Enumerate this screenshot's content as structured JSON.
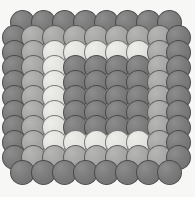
{
  "figure": {
    "canvas": {
      "width": 195,
      "height": 197
    },
    "background_color": "#f7f7f5",
    "outline_color": "#282828"
  },
  "palette": {
    "dark": "#7c7c7c",
    "mid": "#a6a6a4",
    "light": "#e2e2df",
    "background": "#f7f7f5"
  },
  "chart_data": {
    "type": "scatter",
    "title": "",
    "xlabel": "",
    "ylabel": "",
    "grid": false,
    "legend": "none",
    "xlim": [
      0,
      195
    ],
    "ylim": [
      0,
      197
    ],
    "marker": "circle",
    "marker_diameter": 25,
    "rings": [
      {
        "name": "outer-ring",
        "shade": "dark",
        "packing": "offset-hex",
        "rows": 11
      },
      {
        "name": "second-ring",
        "shade": "mid",
        "packing": "offset-hex",
        "rows": 9
      },
      {
        "name": "third-ring",
        "shade": "light",
        "packing": "offset-hex",
        "rows": 7
      },
      {
        "name": "core-block",
        "shade": "dark",
        "packing": "square",
        "rows": 5,
        "cols": 6
      }
    ],
    "series": [
      {
        "name": "dark-discs",
        "color": "#7c7c7c",
        "count": 76
      },
      {
        "name": "mid-discs",
        "color": "#a6a6a4",
        "count": 40
      },
      {
        "name": "light-discs",
        "color": "#e2e2df",
        "count": 28
      }
    ],
    "discs": [
      {
        "x": 22,
        "y": 22,
        "s": "dark"
      },
      {
        "x": 43,
        "y": 22,
        "s": "dark"
      },
      {
        "x": 64,
        "y": 22,
        "s": "dark"
      },
      {
        "x": 85,
        "y": 22,
        "s": "dark"
      },
      {
        "x": 106,
        "y": 22,
        "s": "dark"
      },
      {
        "x": 127,
        "y": 22,
        "s": "dark"
      },
      {
        "x": 148,
        "y": 22,
        "s": "dark"
      },
      {
        "x": 169,
        "y": 22,
        "s": "dark"
      },
      {
        "x": 14,
        "y": 37,
        "s": "dark"
      },
      {
        "x": 33,
        "y": 37,
        "s": "mid"
      },
      {
        "x": 54,
        "y": 37,
        "s": "mid"
      },
      {
        "x": 75,
        "y": 37,
        "s": "mid"
      },
      {
        "x": 96,
        "y": 37,
        "s": "mid"
      },
      {
        "x": 117,
        "y": 37,
        "s": "mid"
      },
      {
        "x": 138,
        "y": 37,
        "s": "mid"
      },
      {
        "x": 159,
        "y": 37,
        "s": "mid"
      },
      {
        "x": 178,
        "y": 37,
        "s": "dark"
      },
      {
        "x": 14,
        "y": 52,
        "s": "dark"
      },
      {
        "x": 33,
        "y": 52,
        "s": "mid"
      },
      {
        "x": 54,
        "y": 52,
        "s": "light"
      },
      {
        "x": 75,
        "y": 52,
        "s": "light"
      },
      {
        "x": 96,
        "y": 52,
        "s": "light"
      },
      {
        "x": 117,
        "y": 52,
        "s": "light"
      },
      {
        "x": 138,
        "y": 52,
        "s": "light"
      },
      {
        "x": 159,
        "y": 52,
        "s": "mid"
      },
      {
        "x": 178,
        "y": 52,
        "s": "dark"
      },
      {
        "x": 14,
        "y": 67,
        "s": "dark"
      },
      {
        "x": 33,
        "y": 67,
        "s": "mid"
      },
      {
        "x": 54,
        "y": 67,
        "s": "light"
      },
      {
        "x": 75,
        "y": 67,
        "s": "dark"
      },
      {
        "x": 96,
        "y": 67,
        "s": "dark"
      },
      {
        "x": 117,
        "y": 67,
        "s": "dark"
      },
      {
        "x": 138,
        "y": 67,
        "s": "dark"
      },
      {
        "x": 159,
        "y": 67,
        "s": "mid"
      },
      {
        "x": 178,
        "y": 67,
        "s": "dark"
      },
      {
        "x": 14,
        "y": 82,
        "s": "dark"
      },
      {
        "x": 33,
        "y": 82,
        "s": "mid"
      },
      {
        "x": 54,
        "y": 82,
        "s": "light"
      },
      {
        "x": 75,
        "y": 82,
        "s": "dark"
      },
      {
        "x": 96,
        "y": 82,
        "s": "dark"
      },
      {
        "x": 117,
        "y": 82,
        "s": "dark"
      },
      {
        "x": 138,
        "y": 82,
        "s": "dark"
      },
      {
        "x": 159,
        "y": 82,
        "s": "mid"
      },
      {
        "x": 178,
        "y": 82,
        "s": "dark"
      },
      {
        "x": 14,
        "y": 97,
        "s": "dark"
      },
      {
        "x": 33,
        "y": 97,
        "s": "mid"
      },
      {
        "x": 54,
        "y": 97,
        "s": "light"
      },
      {
        "x": 75,
        "y": 97,
        "s": "dark"
      },
      {
        "x": 96,
        "y": 97,
        "s": "dark"
      },
      {
        "x": 117,
        "y": 97,
        "s": "dark"
      },
      {
        "x": 138,
        "y": 97,
        "s": "dark"
      },
      {
        "x": 159,
        "y": 97,
        "s": "mid"
      },
      {
        "x": 178,
        "y": 97,
        "s": "dark"
      },
      {
        "x": 14,
        "y": 112,
        "s": "dark"
      },
      {
        "x": 33,
        "y": 112,
        "s": "mid"
      },
      {
        "x": 54,
        "y": 112,
        "s": "light"
      },
      {
        "x": 75,
        "y": 112,
        "s": "dark"
      },
      {
        "x": 96,
        "y": 112,
        "s": "dark"
      },
      {
        "x": 117,
        "y": 112,
        "s": "dark"
      },
      {
        "x": 138,
        "y": 112,
        "s": "dark"
      },
      {
        "x": 159,
        "y": 112,
        "s": "mid"
      },
      {
        "x": 178,
        "y": 112,
        "s": "dark"
      },
      {
        "x": 14,
        "y": 127,
        "s": "dark"
      },
      {
        "x": 33,
        "y": 127,
        "s": "mid"
      },
      {
        "x": 54,
        "y": 127,
        "s": "light"
      },
      {
        "x": 75,
        "y": 127,
        "s": "dark"
      },
      {
        "x": 96,
        "y": 127,
        "s": "dark"
      },
      {
        "x": 117,
        "y": 127,
        "s": "dark"
      },
      {
        "x": 138,
        "y": 127,
        "s": "dark"
      },
      {
        "x": 159,
        "y": 127,
        "s": "mid"
      },
      {
        "x": 178,
        "y": 127,
        "s": "dark"
      },
      {
        "x": 14,
        "y": 142,
        "s": "dark"
      },
      {
        "x": 33,
        "y": 142,
        "s": "mid"
      },
      {
        "x": 54,
        "y": 142,
        "s": "light"
      },
      {
        "x": 75,
        "y": 142,
        "s": "light"
      },
      {
        "x": 96,
        "y": 142,
        "s": "light"
      },
      {
        "x": 117,
        "y": 142,
        "s": "light"
      },
      {
        "x": 138,
        "y": 142,
        "s": "light"
      },
      {
        "x": 159,
        "y": 142,
        "s": "mid"
      },
      {
        "x": 178,
        "y": 142,
        "s": "dark"
      },
      {
        "x": 14,
        "y": 157,
        "s": "dark"
      },
      {
        "x": 33,
        "y": 157,
        "s": "mid"
      },
      {
        "x": 54,
        "y": 157,
        "s": "mid"
      },
      {
        "x": 75,
        "y": 157,
        "s": "mid"
      },
      {
        "x": 96,
        "y": 157,
        "s": "mid"
      },
      {
        "x": 117,
        "y": 157,
        "s": "mid"
      },
      {
        "x": 138,
        "y": 157,
        "s": "mid"
      },
      {
        "x": 159,
        "y": 157,
        "s": "mid"
      },
      {
        "x": 178,
        "y": 157,
        "s": "dark"
      },
      {
        "x": 22,
        "y": 172,
        "s": "dark"
      },
      {
        "x": 43,
        "y": 172,
        "s": "dark"
      },
      {
        "x": 64,
        "y": 172,
        "s": "dark"
      },
      {
        "x": 85,
        "y": 172,
        "s": "dark"
      },
      {
        "x": 106,
        "y": 172,
        "s": "dark"
      },
      {
        "x": 127,
        "y": 172,
        "s": "dark"
      },
      {
        "x": 148,
        "y": 172,
        "s": "dark"
      },
      {
        "x": 169,
        "y": 172,
        "s": "dark"
      }
    ]
  }
}
